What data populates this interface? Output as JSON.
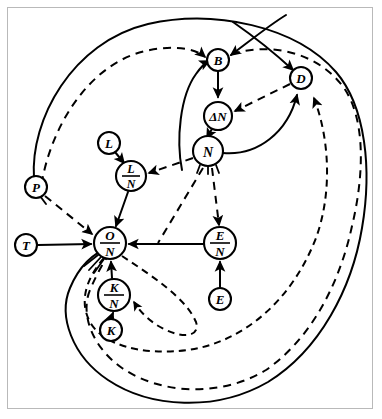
{
  "figure": {
    "title": "",
    "background_color": "#ffffff",
    "frame_color": "#b9b9b9",
    "line_color": "#000000",
    "width": 382,
    "height": 419
  },
  "nodes": [
    {
      "id": "B",
      "label": "B",
      "kind": "single",
      "numerator": "B",
      "denominator": "",
      "cx": 218,
      "cy": 60,
      "r": 11
    },
    {
      "id": "D",
      "label": "D",
      "kind": "single",
      "numerator": "D",
      "denominator": "",
      "cx": 301,
      "cy": 78,
      "r": 11
    },
    {
      "id": "DN",
      "label": "ΔN",
      "kind": "single",
      "numerator": "ΔN",
      "denominator": "",
      "cx": 218,
      "cy": 116,
      "r": 14
    },
    {
      "id": "N",
      "label": "N",
      "kind": "single",
      "numerator": "N",
      "denominator": "",
      "cx": 208,
      "cy": 151,
      "r": 15
    },
    {
      "id": "L",
      "label": "L",
      "kind": "single",
      "numerator": "L",
      "denominator": "",
      "cx": 109,
      "cy": 143,
      "r": 11
    },
    {
      "id": "L_N",
      "label": "L/N",
      "kind": "fraction",
      "numerator": "L",
      "denominator": "N",
      "cx": 131,
      "cy": 176,
      "r": 15
    },
    {
      "id": "P",
      "label": "P",
      "kind": "single",
      "numerator": "P",
      "denominator": "",
      "cx": 36,
      "cy": 187,
      "r": 11
    },
    {
      "id": "T",
      "label": "T",
      "kind": "single",
      "numerator": "T",
      "denominator": "",
      "cx": 26,
      "cy": 245,
      "r": 11
    },
    {
      "id": "O_N",
      "label": "O/N",
      "kind": "fraction",
      "numerator": "O",
      "denominator": "N",
      "cx": 110,
      "cy": 243,
      "r": 16
    },
    {
      "id": "E_N",
      "label": "E/N",
      "kind": "fraction",
      "numerator": "E",
      "denominator": "N",
      "cx": 220,
      "cy": 243,
      "r": 16
    },
    {
      "id": "K_N",
      "label": "K/N",
      "kind": "fraction",
      "numerator": "K",
      "denominator": "N",
      "cx": 114,
      "cy": 295,
      "r": 16
    },
    {
      "id": "K",
      "label": "K",
      "kind": "single",
      "numerator": "K",
      "denominator": "",
      "cx": 111,
      "cy": 330,
      "r": 11
    },
    {
      "id": "E",
      "label": "E",
      "kind": "single",
      "numerator": "E",
      "denominator": "",
      "cx": 220,
      "cy": 299,
      "r": 11
    }
  ],
  "edges": [
    {
      "id": "e-B-DN",
      "from": "B",
      "to": "DN",
      "style": "solid",
      "arrow": true
    },
    {
      "id": "e-DN-N",
      "from": "DN",
      "to": "N",
      "style": "solid",
      "arrow": true
    },
    {
      "id": "e-N-B",
      "from": "N",
      "to": "B",
      "style": "solid",
      "arrow": true
    },
    {
      "id": "e-N-D",
      "from": "N",
      "to": "D",
      "style": "solid",
      "arrow": true
    },
    {
      "id": "e-D-DN",
      "from": "D",
      "to": "DN",
      "style": "dashed",
      "arrow": true
    },
    {
      "id": "e-N-L_N",
      "from": "N",
      "to": "L_N",
      "style": "dashed",
      "arrow": true
    },
    {
      "id": "e-L-L_N",
      "from": "L",
      "to": "L_N",
      "style": "solid",
      "arrow": true
    },
    {
      "id": "e-L_N-O_N",
      "from": "L_N",
      "to": "O_N",
      "style": "solid",
      "arrow": true
    },
    {
      "id": "e-T-O_N",
      "from": "T",
      "to": "O_N",
      "style": "solid",
      "arrow": true
    },
    {
      "id": "e-P-O_N",
      "from": "P",
      "to": "O_N",
      "style": "dashed",
      "arrow": true
    },
    {
      "id": "e-E_N-O_N",
      "from": "E_N",
      "to": "O_N",
      "style": "solid",
      "arrow": true
    },
    {
      "id": "e-K_N-O_N",
      "from": "K_N",
      "to": "O_N",
      "style": "solid",
      "arrow": true
    },
    {
      "id": "e-K-K_N",
      "from": "K",
      "to": "K_N",
      "style": "solid",
      "arrow": true
    },
    {
      "id": "e-E-E_N",
      "from": "E",
      "to": "E_N",
      "style": "solid",
      "arrow": true
    },
    {
      "id": "e-N-E_N",
      "from": "N",
      "to": "E_N",
      "style": "dashed",
      "arrow": true
    },
    {
      "id": "e-N-ll",
      "from": "N",
      "to": "O_N",
      "style": "dashed",
      "arrow": false
    },
    {
      "id": "e-O_N-D",
      "from": "O_N",
      "to": "D",
      "style": "dashed",
      "arrow": true
    },
    {
      "id": "e-K_N-in",
      "from": "O_N",
      "to": "K_N",
      "style": "dashed",
      "arrow": true
    },
    {
      "id": "e-P-B-out",
      "from": "P",
      "to": "B",
      "style": "solid",
      "arrow": true
    },
    {
      "id": "e-loop-B",
      "from": "O_N",
      "to": "B",
      "style": "dashed",
      "arrow": true
    },
    {
      "id": "e-loop-D",
      "from": "O_N",
      "to": "D",
      "style": "dashed",
      "arrow": true
    },
    {
      "id": "e-long-B",
      "from": "D",
      "to": "B",
      "style": "solid",
      "arrow": true
    },
    {
      "id": "e-long-D",
      "from": "B",
      "to": "D",
      "style": "solid",
      "arrow": true
    }
  ]
}
